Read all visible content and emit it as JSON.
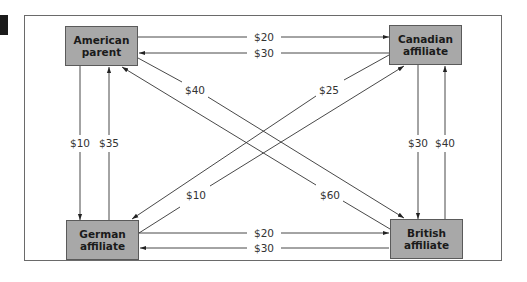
{
  "diagram": {
    "title": "",
    "nodes": [
      {
        "id": "american",
        "line1": "American",
        "line2": "parent"
      },
      {
        "id": "canadian",
        "line1": "Canadian",
        "line2": "affiliate"
      },
      {
        "id": "german",
        "line1": "German",
        "line2": "affiliate"
      },
      {
        "id": "british",
        "line1": "British",
        "line2": "affiliate"
      }
    ],
    "flows": [
      {
        "from": "American parent",
        "to": "Canadian affiliate",
        "amount": "$20"
      },
      {
        "from": "Canadian affiliate",
        "to": "American parent",
        "amount": "$30"
      },
      {
        "from": "American parent",
        "to": "German affiliate",
        "amount": "$10"
      },
      {
        "from": "German affiliate",
        "to": "American parent",
        "amount": "$35"
      },
      {
        "from": "Canadian affiliate",
        "to": "British affiliate",
        "amount": "$30"
      },
      {
        "from": "British affiliate",
        "to": "Canadian affiliate",
        "amount": "$40"
      },
      {
        "from": "German affiliate",
        "to": "British affiliate",
        "amount": "$20"
      },
      {
        "from": "British affiliate",
        "to": "German affiliate",
        "amount": "$30"
      },
      {
        "from": "American parent",
        "to": "British affiliate",
        "amount": "$40"
      },
      {
        "from": "British affiliate",
        "to": "American parent",
        "amount": "$60"
      },
      {
        "from": "Canadian affiliate",
        "to": "German affiliate",
        "amount": "$25"
      },
      {
        "from": "German affiliate",
        "to": "Canadian affiliate",
        "amount": "$10"
      }
    ],
    "colors": {
      "box_fill": "#a8a8a8",
      "box_border": "#5a5a5a",
      "line": "#333333",
      "frame": "#6a6a6a"
    }
  }
}
